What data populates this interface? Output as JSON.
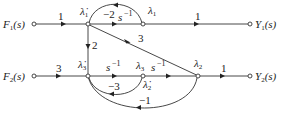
{
  "diagram": {
    "type": "signal-flow-graph",
    "nodes": {
      "F1": {
        "label": "F",
        "sub": "1",
        "tail": "(s)"
      },
      "Y1": {
        "label": "Y",
        "sub": "1",
        "tail": "(s)"
      },
      "F2": {
        "label": "F",
        "sub": "2",
        "tail": "(s)"
      },
      "Y2": {
        "label": "Y",
        "sub": "2",
        "tail": "(s)"
      },
      "ld1": {
        "label": "λ̇",
        "sub": "1"
      },
      "l1": {
        "label": "λ",
        "sub": "1"
      },
      "ld3": {
        "label": "λ̇",
        "sub": "3"
      },
      "l3": {
        "label": "λ",
        "sub": "3"
      },
      "ld2": {
        "label": "λ̇",
        "sub": "2"
      },
      "l2": {
        "label": "λ",
        "sub": "2"
      }
    },
    "edges": [
      {
        "from": "F1",
        "to": "ld1",
        "gain": "1"
      },
      {
        "from": "ld1",
        "to": "l1",
        "gain": "s⁻¹"
      },
      {
        "from": "l1",
        "to": "ld1",
        "gain": "−2"
      },
      {
        "from": "l1",
        "to": "Y1",
        "gain": "1"
      },
      {
        "from": "ld1",
        "to": "ld3",
        "gain": "2"
      },
      {
        "from": "ld1",
        "to": "l2",
        "gain": "3"
      },
      {
        "from": "F2",
        "to": "ld3",
        "gain": "3"
      },
      {
        "from": "ld3",
        "to": "l3",
        "gain": "s⁻¹"
      },
      {
        "from": "l3",
        "to": "l2",
        "gain": "s⁻¹"
      },
      {
        "from": "l3",
        "to": "ld3",
        "gain": "−3"
      },
      {
        "from": "l2",
        "to": "ld3",
        "gain": "−1"
      },
      {
        "from": "l2",
        "to": "Y2",
        "gain": "1"
      }
    ],
    "gains": {
      "f1_in": "1",
      "top_fwd": "s",
      "top_fwd_exp": "−1",
      "top_fb": "−2",
      "top_out": "1",
      "vert": "2",
      "diag": "3",
      "f2_in": "3",
      "bot_fwd1": "s",
      "bot_fwd1_exp": "−1",
      "bot_fwd2": "s",
      "bot_fwd2_exp": "−1",
      "fb_inner": "−3",
      "fb_outer": "−1",
      "bot_out": "1"
    }
  }
}
